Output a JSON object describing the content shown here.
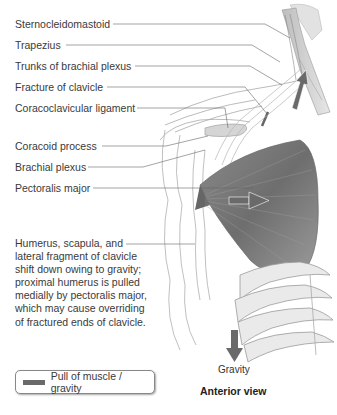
{
  "labels": {
    "sternocleidomastoid": "Sternocleidomastoid",
    "trapezius": "Trapezius",
    "trunks_brachial_plexus": "Trunks of brachial plexus",
    "fracture_clavicle": "Fracture of clavicle",
    "coracoclavicular_ligament": "Coracoclavicular ligament",
    "coracoid_process": "Coracoid process",
    "brachial_plexus": "Brachial plexus",
    "pectoralis_major": "Pectoralis major"
  },
  "note": "Humerus, scapula, and\nlateral fragment of clavicle\nshift down owing to gravity;\nproximal humerus is pulled\nmedially by pectoralis major,\nwhich may cause overriding\nof fractured ends of clavicle.",
  "arrow_labels": {
    "gravity": "Gravity"
  },
  "caption": "Anterior view",
  "legend": {
    "label": "Pull of muscle / gravity",
    "color": "#6a6a6a"
  }
}
